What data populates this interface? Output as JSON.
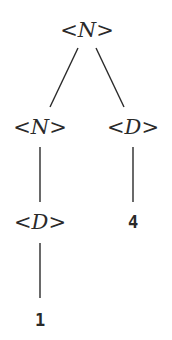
{
  "diagram": {
    "type": "parse-tree",
    "nodes": [
      {
        "id": "n0",
        "label_open": "<",
        "symbol": "N",
        "label_close": ">",
        "kind": "nonterminal",
        "x": 87,
        "y": 30
      },
      {
        "id": "n1",
        "label_open": "<",
        "symbol": "N",
        "label_close": ">",
        "kind": "nonterminal",
        "x": 40,
        "y": 127
      },
      {
        "id": "n2",
        "label_open": "<",
        "symbol": "D",
        "label_close": ">",
        "kind": "nonterminal",
        "x": 133,
        "y": 127
      },
      {
        "id": "n3",
        "label_open": "<",
        "symbol": "D",
        "label_close": ">",
        "kind": "nonterminal",
        "x": 40,
        "y": 222
      },
      {
        "id": "n4",
        "value": "4",
        "kind": "terminal",
        "x": 133,
        "y": 222
      },
      {
        "id": "n5",
        "value": "1",
        "kind": "terminal",
        "x": 40,
        "y": 320
      }
    ],
    "edges": [
      {
        "from": "n0",
        "to": "n1"
      },
      {
        "from": "n0",
        "to": "n2"
      },
      {
        "from": "n1",
        "to": "n3"
      },
      {
        "from": "n2",
        "to": "n4"
      },
      {
        "from": "n3",
        "to": "n5"
      }
    ],
    "colors": {
      "ink": "#2a2a2a",
      "background": "#ffffff"
    }
  }
}
